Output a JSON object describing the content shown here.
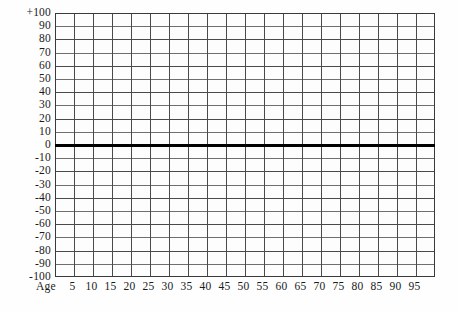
{
  "chart_data": {
    "type": "line",
    "title": "",
    "subtitle": "",
    "xlabel": "Age",
    "ylabel": "",
    "xlim": [
      0,
      100
    ],
    "ylim": [
      -100,
      100
    ],
    "grid": true,
    "legend": null,
    "annotations": [],
    "series": [
      {
        "name": "zero-baseline",
        "values": [
          0,
          0
        ],
        "x": [
          0,
          100
        ],
        "style": "thick-black-horizontal-rule",
        "color": "#000000"
      }
    ],
    "x_ticks": [
      5,
      10,
      15,
      20,
      25,
      30,
      35,
      40,
      45,
      50,
      55,
      60,
      65,
      70,
      75,
      80,
      85,
      90,
      95
    ],
    "x_tick_labels": [
      "5",
      "10",
      "15",
      "20",
      "25",
      "30",
      "35",
      "40",
      "45",
      "50",
      "55",
      "60",
      "65",
      "70",
      "75",
      "80",
      "85",
      "90",
      "95"
    ],
    "y_ticks": [
      100,
      90,
      80,
      70,
      60,
      50,
      40,
      30,
      20,
      10,
      0,
      -10,
      -20,
      -30,
      -40,
      -50,
      -60,
      -70,
      -80,
      -90,
      -100
    ],
    "y_tick_labels": [
      "+100",
      "90",
      "80",
      "70",
      "60",
      "50",
      "40",
      "30",
      "20",
      "10",
      "0",
      "-10",
      "-20",
      "-30",
      "-40",
      "-50",
      "-60",
      "-70",
      "-80",
      "-90",
      "-100"
    ],
    "x_major_step": 5,
    "y_major_step": 10,
    "grid_columns": 20,
    "grid_rows": 20,
    "emphasis_line_value": 0,
    "data_points": []
  },
  "colors": {
    "background": "#fefefe",
    "plot_background": "#fdfdfd",
    "gridline": "#4a4a4a",
    "gridline_light": "#6f6f6f",
    "frame": "#3a3a3a",
    "zero_line": "#000000",
    "text": "#1b1b1b"
  },
  "axis": {
    "x_title": "Age"
  }
}
